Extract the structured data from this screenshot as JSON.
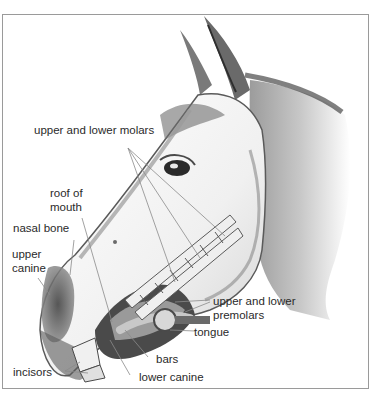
{
  "figure": {
    "labels": {
      "upper_lower_molars": "upper and lower molars",
      "roof_of_mouth_1": "roof of",
      "roof_of_mouth_2": "mouth",
      "nasal_bone": "nasal bone",
      "upper_canine_1": "upper",
      "upper_canine_2": "canine",
      "upper_lower_premolars_1": "upper and lower",
      "upper_lower_premolars_2": "premolars",
      "tongue": "tongue",
      "bars": "bars",
      "incisors": "incisors",
      "lower_canine": "lower canine"
    },
    "colors": {
      "frame": "#9a9a9a",
      "label_text": "#2a2a2a",
      "leader_lines": "#8a8a8a",
      "shading_dark": "#3c3c3c",
      "shading_mid": "#8c8c8c",
      "shading_light": "#d6d6d6"
    }
  }
}
